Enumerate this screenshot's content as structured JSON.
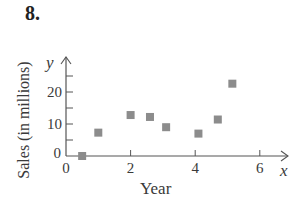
{
  "problem": {
    "number": "8."
  },
  "chart_data": {
    "type": "scatter",
    "title": "",
    "xlabel": "Year",
    "ylabel": "Sales (in millions)",
    "x_var": "x",
    "y_var": "y",
    "xlim": [
      0,
      6.8
    ],
    "ylim": [
      0,
      26
    ],
    "x_ticks": [
      0,
      2,
      4,
      6
    ],
    "x_minor_ticks": [],
    "y_ticks": [
      0,
      10,
      20
    ],
    "y_minor_ticks": [
      5,
      15,
      25
    ],
    "grid": false,
    "legend": null,
    "marker": "square",
    "marker_color": "#8c8c8c",
    "points": [
      {
        "x": 0.5,
        "y": 0
      },
      {
        "x": 1.0,
        "y": 7.3
      },
      {
        "x": 2.0,
        "y": 12.8
      },
      {
        "x": 2.6,
        "y": 12.2
      },
      {
        "x": 3.1,
        "y": 9.0
      },
      {
        "x": 4.1,
        "y": 7.0
      },
      {
        "x": 4.7,
        "y": 11.4
      },
      {
        "x": 5.15,
        "y": 22.6
      }
    ]
  },
  "labels": {
    "x_origin": "0",
    "y_origin": "0"
  }
}
